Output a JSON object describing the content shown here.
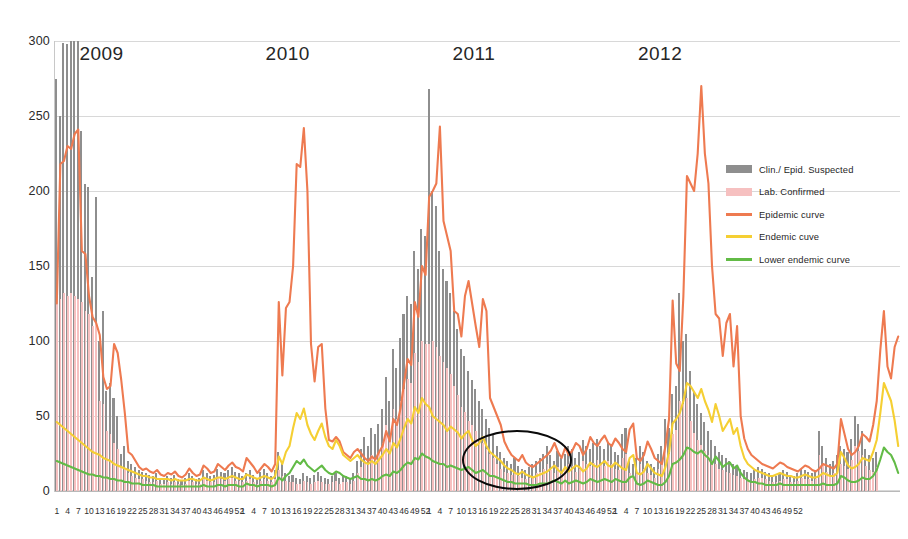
{
  "chart_data": {
    "type": "bar",
    "title": "",
    "subtitle": "",
    "xlabel": "",
    "ylabel": "",
    "ylim": [
      0,
      300
    ],
    "ytick_step": 50,
    "yticks": [
      "0",
      "50",
      "100",
      "150",
      "200",
      "250",
      "300"
    ],
    "grid": true,
    "legend_position": "inside-right",
    "x_description": "Epidemiological week number per year",
    "xtick_interval": 3,
    "years": [
      {
        "label": "2009",
        "weeks": 52
      },
      {
        "label": "2010",
        "weeks": 52
      },
      {
        "label": "2011",
        "weeks": 52
      },
      {
        "label": "2012",
        "weeks": 52
      }
    ],
    "colors": {
      "clin_epid_suspected": "#8e8e8e",
      "lab_confirmed": "#f6c0c0",
      "epidemic_curve": "#ee7košt",
      "epidemic_curve_hex": "#ee7a50",
      "endemic_curve": "#f5cf33",
      "lower_endemic_curve": "#62bb46",
      "gridline": "#d8d8d8",
      "annotation": "#0a0a0a",
      "background": "#ffffff"
    },
    "series": [
      {
        "name": "Clin./ Epid. Suspected",
        "type": "bar",
        "color": "#8e8e8e",
        "values": [
          275,
          250,
          299,
          298,
          300,
          300,
          300,
          240,
          205,
          203,
          143,
          196,
          100,
          120,
          67,
          72,
          62,
          50,
          25,
          30,
          20,
          18,
          16,
          14,
          13,
          12,
          11,
          10,
          12,
          9,
          8,
          10,
          9,
          11,
          8,
          7,
          9,
          12,
          10,
          8,
          9,
          14,
          12,
          10,
          11,
          15,
          13,
          12,
          14,
          16,
          13,
          12,
          10,
          12,
          14,
          11,
          9,
          13,
          15,
          12,
          10,
          14,
          26,
          18,
          12,
          10,
          11,
          9,
          8,
          12,
          10,
          9,
          11,
          13,
          10,
          9,
          8,
          10,
          12,
          9,
          11,
          10,
          9,
          12,
          20,
          28,
          36,
          30,
          42,
          38,
          45,
          55,
          76,
          60,
          95,
          82,
          102,
          118,
          130,
          125,
          160,
          148,
          175,
          170,
          268,
          200,
          190,
          160,
          148,
          140,
          132,
          120,
          108,
          95,
          90,
          80,
          74,
          68,
          60,
          55,
          48,
          42,
          38,
          30,
          26,
          22,
          20,
          18,
          22,
          17,
          15,
          14,
          16,
          18,
          20,
          22,
          25,
          30,
          24,
          20,
          27,
          22,
          25,
          30,
          28,
          22,
          26,
          34,
          30,
          28,
          32,
          35,
          30,
          28,
          33,
          30,
          26,
          24,
          38,
          42,
          20,
          18,
          22,
          30,
          26,
          20,
          18,
          16,
          25,
          30,
          48,
          42,
          65,
          70,
          132,
          100,
          105,
          80,
          66,
          58,
          52,
          46,
          40,
          34,
          30,
          26,
          24,
          22,
          20,
          18,
          16,
          15,
          14,
          13,
          12,
          14,
          16,
          15,
          13,
          12,
          11,
          10,
          12,
          14,
          13,
          11,
          10,
          12,
          15,
          14,
          13,
          12,
          14,
          40,
          30,
          22,
          18,
          20,
          24,
          30,
          28,
          26,
          35,
          50,
          45,
          40,
          28,
          24,
          22,
          26
        ]
      },
      {
        "name": "Lab. Confirmed",
        "type": "bar",
        "color": "#f6c0c0",
        "values": [
          130,
          128,
          132,
          130,
          132,
          130,
          128,
          126,
          120,
          118,
          110,
          112,
          60,
          58,
          40,
          38,
          32,
          28,
          16,
          15,
          12,
          10,
          9,
          8,
          8,
          7,
          6,
          6,
          7,
          5,
          5,
          6,
          5,
          6,
          5,
          4,
          5,
          7,
          6,
          5,
          5,
          8,
          7,
          6,
          6,
          9,
          8,
          7,
          8,
          9,
          7,
          7,
          6,
          7,
          8,
          6,
          5,
          7,
          8,
          7,
          6,
          8,
          14,
          10,
          7,
          6,
          6,
          5,
          5,
          7,
          6,
          5,
          6,
          7,
          6,
          5,
          5,
          6,
          7,
          5,
          6,
          6,
          5,
          7,
          12,
          16,
          20,
          18,
          24,
          22,
          26,
          32,
          44,
          35,
          55,
          48,
          60,
          68,
          75,
          72,
          92,
          86,
          100,
          98,
          98,
          100,
          96,
          90,
          86,
          82,
          78,
          70,
          64,
          56,
          53,
          47,
          44,
          40,
          35,
          32,
          28,
          25,
          22,
          18,
          15,
          13,
          12,
          11,
          13,
          10,
          9,
          8,
          9,
          10,
          12,
          13,
          15,
          18,
          14,
          12,
          16,
          13,
          15,
          18,
          17,
          13,
          15,
          20,
          18,
          17,
          19,
          21,
          18,
          17,
          20,
          18,
          15,
          14,
          22,
          25,
          12,
          11,
          13,
          18,
          15,
          12,
          11,
          9,
          15,
          18,
          28,
          25,
          38,
          41,
          60,
          58,
          62,
          47,
          39,
          34,
          31,
          27,
          24,
          20,
          18,
          15,
          14,
          13,
          12,
          11,
          10,
          9,
          8,
          8,
          7,
          8,
          9,
          9,
          8,
          7,
          6,
          6,
          7,
          8,
          8,
          6,
          6,
          7,
          9,
          8,
          8,
          7,
          8,
          24,
          18,
          13,
          11,
          12,
          14,
          18,
          17,
          15,
          21,
          30,
          27,
          24,
          17,
          14,
          13,
          16
        ]
      },
      {
        "name": "Epidemic curve",
        "type": "line",
        "color": "#ee7a50",
        "values": [
          125,
          218,
          220,
          230,
          228,
          238,
          241,
          160,
          158,
          130,
          116,
          112,
          104,
          76,
          68,
          70,
          98,
          92,
          74,
          52,
          26,
          24,
          20,
          16,
          14,
          15,
          13,
          12,
          14,
          11,
          10,
          12,
          11,
          13,
          10,
          9,
          11,
          15,
          12,
          10,
          11,
          17,
          15,
          12,
          13,
          18,
          16,
          14,
          17,
          19,
          16,
          15,
          13,
          22,
          19,
          16,
          12,
          15,
          18,
          16,
          13,
          18,
          126,
          77,
          122,
          126,
          150,
          218,
          216,
          242,
          200,
          98,
          73,
          96,
          98,
          55,
          34,
          33,
          36,
          33,
          26,
          24,
          22,
          26,
          28,
          25,
          22,
          20,
          23,
          21,
          26,
          30,
          40,
          33,
          48,
          44,
          55,
          72,
          88,
          84,
          126,
          116,
          150,
          144,
          196,
          200,
          205,
          243,
          180,
          170,
          160,
          120,
          118,
          103,
          130,
          140,
          125,
          110,
          96,
          128,
          120,
          62,
          56,
          50,
          44,
          33,
          28,
          24,
          22,
          20,
          24,
          19,
          17,
          16,
          18,
          20,
          22,
          24,
          27,
          32,
          26,
          22,
          29,
          24,
          27,
          32,
          30,
          24,
          28,
          36,
          32,
          30,
          34,
          37,
          32,
          30,
          35,
          32,
          28,
          26,
          41,
          45,
          22,
          20,
          24,
          33,
          28,
          22,
          20,
          18,
          30,
          48,
          127,
          85,
          80,
          130,
          210,
          205,
          200,
          225,
          270,
          225,
          205,
          150,
          118,
          115,
          90,
          112,
          118,
          83,
          110,
          50,
          35,
          28,
          24,
          22,
          20,
          18,
          17,
          16,
          15,
          17,
          19,
          18,
          16,
          15,
          14,
          13,
          15,
          17,
          16,
          14,
          13,
          15,
          18,
          17,
          16,
          15,
          18,
          48,
          38,
          28,
          24,
          26,
          30,
          38,
          36,
          33,
          44,
          60,
          94,
          120,
          83,
          75,
          96,
          103
        ]
      },
      {
        "name": "Endemic cuve",
        "type": "line",
        "color": "#f5cf33",
        "values": [
          46,
          44,
          42,
          40,
          38,
          36,
          34,
          32,
          30,
          28,
          26,
          25,
          24,
          22,
          21,
          20,
          18,
          17,
          16,
          15,
          14,
          13,
          12,
          11,
          10,
          10,
          9,
          9,
          8,
          8,
          8,
          8,
          7,
          8,
          7,
          7,
          7,
          8,
          8,
          7,
          7,
          9,
          8,
          7,
          8,
          9,
          9,
          8,
          9,
          10,
          9,
          8,
          8,
          11,
          10,
          9,
          8,
          9,
          10,
          9,
          8,
          10,
          23,
          18,
          26,
          30,
          42,
          52,
          48,
          55,
          44,
          38,
          34,
          40,
          45,
          36,
          30,
          28,
          34,
          30,
          24,
          22,
          20,
          22,
          24,
          21,
          19,
          18,
          20,
          18,
          21,
          24,
          28,
          25,
          32,
          29,
          35,
          42,
          48,
          45,
          56,
          52,
          62,
          58,
          56,
          50,
          48,
          46,
          44,
          40,
          43,
          41,
          39,
          35,
          38,
          40,
          34,
          30,
          32,
          36,
          30,
          26,
          24,
          22,
          20,
          17,
          15,
          14,
          12,
          11,
          13,
          11,
          10,
          9,
          10,
          11,
          12,
          13,
          15,
          17,
          14,
          12,
          16,
          13,
          15,
          17,
          16,
          13,
          15,
          19,
          17,
          16,
          18,
          20,
          17,
          16,
          19,
          17,
          15,
          14,
          22,
          24,
          12,
          11,
          13,
          18,
          15,
          12,
          11,
          10,
          16,
          26,
          45,
          48,
          52,
          60,
          72,
          70,
          66,
          62,
          68,
          60,
          54,
          46,
          58,
          50,
          40,
          44,
          48,
          38,
          42,
          30,
          22,
          18,
          16,
          14,
          13,
          12,
          11,
          10,
          10,
          11,
          12,
          11,
          10,
          10,
          9,
          9,
          10,
          11,
          10,
          9,
          9,
          10,
          12,
          11,
          10,
          10,
          12,
          26,
          22,
          17,
          15,
          16,
          18,
          22,
          21,
          20,
          26,
          34,
          52,
          72,
          66,
          60,
          47,
          30
        ]
      },
      {
        "name": "Lower endemic curve",
        "type": "line",
        "color": "#62bb46",
        "values": [
          20,
          19,
          18,
          17,
          16,
          15,
          14,
          13,
          12,
          11,
          11,
          10,
          10,
          9,
          9,
          8,
          8,
          7,
          7,
          6,
          6,
          5,
          5,
          5,
          4,
          4,
          4,
          4,
          3,
          3,
          3,
          3,
          3,
          3,
          3,
          3,
          3,
          3,
          3,
          3,
          3,
          4,
          3,
          3,
          3,
          4,
          4,
          3,
          4,
          4,
          4,
          3,
          3,
          5,
          4,
          4,
          3,
          4,
          4,
          4,
          3,
          4,
          9,
          7,
          10,
          12,
          16,
          20,
          18,
          21,
          17,
          15,
          13,
          15,
          17,
          14,
          12,
          11,
          13,
          12,
          10,
          9,
          8,
          9,
          10,
          8,
          8,
          7,
          8,
          7,
          8,
          10,
          11,
          10,
          13,
          12,
          14,
          17,
          19,
          18,
          22,
          21,
          25,
          23,
          22,
          20,
          19,
          18,
          18,
          16,
          17,
          16,
          15,
          14,
          15,
          16,
          14,
          12,
          13,
          14,
          12,
          10,
          10,
          9,
          8,
          7,
          6,
          6,
          5,
          5,
          5,
          5,
          4,
          4,
          4,
          5,
          5,
          5,
          6,
          7,
          6,
          5,
          7,
          5,
          6,
          7,
          6,
          5,
          6,
          8,
          7,
          6,
          7,
          8,
          7,
          6,
          8,
          7,
          6,
          6,
          9,
          10,
          5,
          4,
          5,
          7,
          6,
          5,
          4,
          4,
          6,
          10,
          18,
          19,
          21,
          24,
          29,
          28,
          26,
          25,
          27,
          24,
          22,
          18,
          23,
          20,
          16,
          18,
          19,
          15,
          17,
          12,
          9,
          7,
          6,
          6,
          5,
          5,
          4,
          4,
          4,
          4,
          5,
          4,
          4,
          4,
          4,
          4,
          4,
          4,
          4,
          4,
          4,
          4,
          5,
          4,
          4,
          4,
          5,
          10,
          9,
          7,
          6,
          6,
          7,
          9,
          8,
          8,
          10,
          14,
          21,
          29,
          26,
          24,
          19,
          12
        ]
      }
    ],
    "annotation": {
      "type": "ellipse",
      "label": "highlight-ellipse",
      "center_week_index": 128,
      "note": "Black ellipse highlighting the inter-epidemic low period in mid-2011"
    }
  },
  "legend": {
    "items": [
      {
        "label": "Clin./ Epid. Suspected",
        "swatch": "block",
        "color": "#8e8e8e"
      },
      {
        "label": "Lab. Confirmed",
        "swatch": "block",
        "color": "#f6c0c0"
      },
      {
        "label": "Epidemic curve",
        "swatch": "line",
        "color": "#ee7a50"
      },
      {
        "label": "Endemic cuve",
        "swatch": "line",
        "color": "#f5cf33"
      },
      {
        "label": "Lower endemic curve",
        "swatch": "line",
        "color": "#62bb46"
      }
    ]
  }
}
